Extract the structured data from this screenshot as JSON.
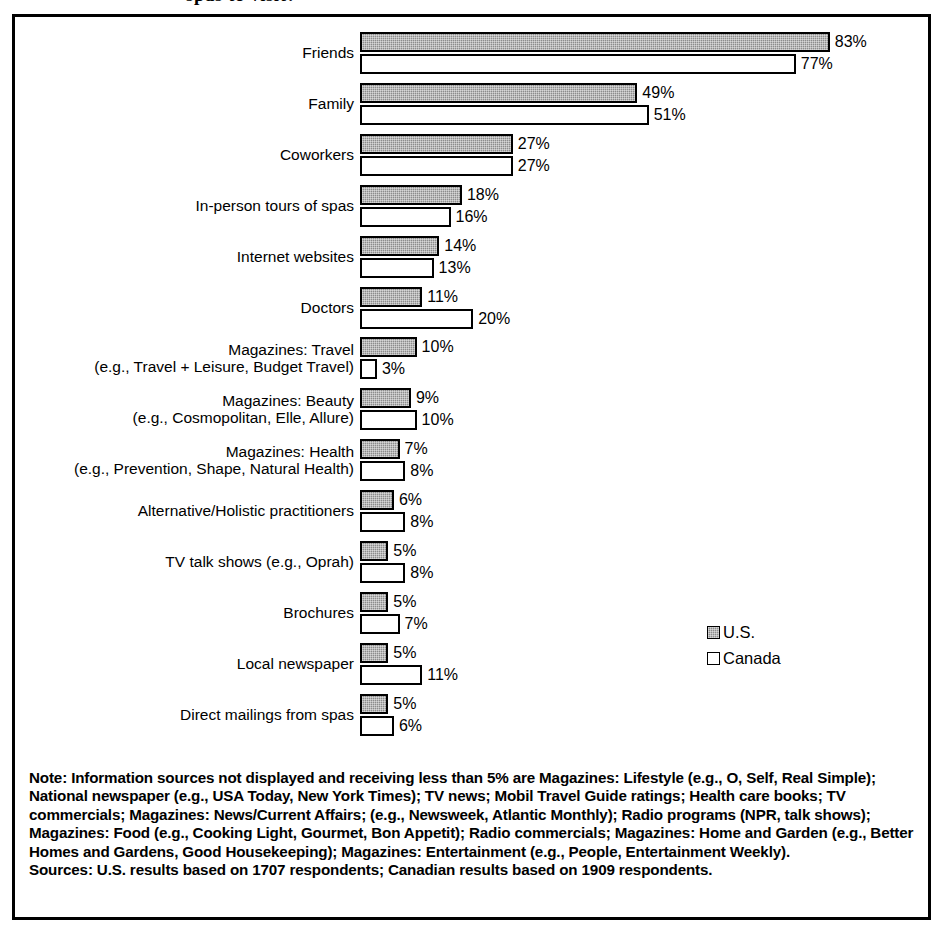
{
  "title_partial": "spas to visit?",
  "legend": {
    "position": "inside-right-lower",
    "entries": [
      {
        "label": "U.S.",
        "swatch": "filled-hatched-square-icon",
        "color": "#8c8c8c"
      },
      {
        "label": "Canada",
        "swatch": "empty-square-icon",
        "color": "#ffffff"
      }
    ]
  },
  "footnotes": {
    "note": "Note: Information sources not displayed and receiving less than 5% are Magazines: Lifestyle (e.g., O, Self, Real Simple); National newspaper (e.g., USA Today, New York Times); TV news; Mobil Travel Guide ratings; Health care books; TV commercials; Magazines: News/Current Affairs; (e.g., Newsweek, Atlantic Monthly); Radio programs (NPR, talk shows); Magazines: Food (e.g., Cooking Light, Gourmet, Bon Appetit); Radio commercials; Magazines: Home and Garden (e.g., Better Homes and Gardens, Good Housekeeping); Magazines: Entertainment (e.g., People, Entertainment Weekly).",
    "sources": "Sources: U.S. results based on 1707 respondents; Canadian results based on 1909 respondents."
  },
  "chart_data": {
    "type": "bar",
    "orientation": "horizontal",
    "title": "spas to visit?",
    "xlabel": "",
    "ylabel": "",
    "xlim": [
      0,
      83
    ],
    "grid": false,
    "legend_position": "inside-right-lower",
    "value_suffix": "%",
    "categories": [
      "Friends",
      "Family",
      "Coworkers",
      "In-person tours of spas",
      "Internet websites",
      "Doctors",
      "Magazines: Travel\n(e.g., Travel + Leisure, Budget Travel)",
      "Magazines: Beauty\n(e.g., Cosmopolitan, Elle, Allure)",
      "Magazines: Health\n(e.g., Prevention, Shape, Natural Health)",
      "Alternative/Holistic practitioners",
      "TV talk shows (e.g., Oprah)",
      "Brochures",
      "Local newspaper",
      "Direct mailings from spas"
    ],
    "series": [
      {
        "name": "U.S.",
        "values": [
          83,
          49,
          27,
          18,
          14,
          11,
          10,
          9,
          7,
          6,
          5,
          5,
          5,
          5
        ],
        "labels": [
          "83%",
          "49%",
          "27%",
          "18%",
          "14%",
          "11%",
          "10%",
          "9%",
          "7%",
          "6%",
          "5%",
          "5%",
          "5%",
          "5%"
        ]
      },
      {
        "name": "Canada",
        "values": [
          77,
          51,
          27,
          16,
          13,
          20,
          3,
          10,
          8,
          8,
          8,
          7,
          11,
          6
        ],
        "labels": [
          "77%",
          "51%",
          "27%",
          "16%",
          "13%",
          "20%",
          "3%",
          "10%",
          "8%",
          "8%",
          "8%",
          "7%",
          "11%",
          "6%"
        ]
      }
    ]
  }
}
